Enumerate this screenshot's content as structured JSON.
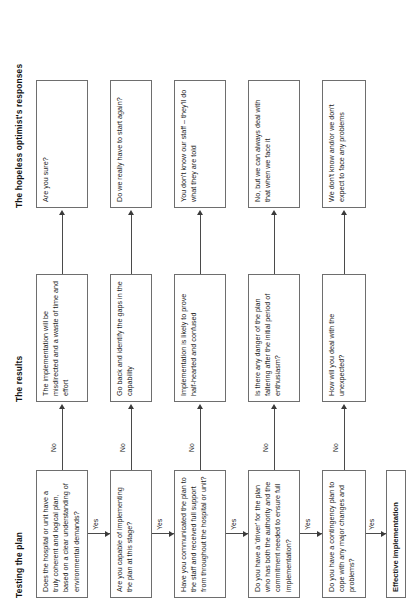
{
  "headers": {
    "col1": "Testing the plan",
    "col2": "The results",
    "col3": "The hopeless optimist's responses"
  },
  "edge_labels": {
    "yes": "Yes",
    "no": "No"
  },
  "rows": [
    {
      "question": "Does the hospital or unit have a truly coherent and logical plan, based on a clear understanding of environmental demands?",
      "result": "The implementation will be misdirected and a waste of time and effort",
      "response": "Are you sure?"
    },
    {
      "question": "Are you capable of implementing the plan at this stage?",
      "result": "Go back and identify the gaps in the capability",
      "response": "Do we really have to start again?"
    },
    {
      "question": "Have you communicated the plan to the staff and received full support from throughout the hospital or unit?",
      "result": "Implementation is likely to prove half-hearted and confused",
      "response": "You don't know our staff – they'll do what they are told"
    },
    {
      "question": "Do you have a 'driver' for the plan who has both the authority and the commitment needed to ensure full implementation?",
      "result": "Is there any danger of the plan faltering after the initial period of enthusiasm?",
      "response": "No, but we can always deal with that when we face it"
    },
    {
      "question": "Do you have a contingency plan to cope with any major changes and problems?",
      "result": "How will you deal with the unexpected?",
      "response": "We don't know and/or we don't expect to face any problems"
    }
  ],
  "outcome": "Effective implementation",
  "colors": {
    "border": "#6e6e6e",
    "connector": "#4a4a4a",
    "text": "#1b1b1b"
  }
}
